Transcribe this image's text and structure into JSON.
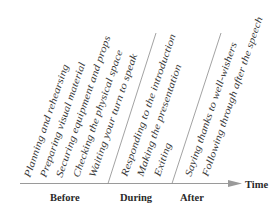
{
  "diagram": {
    "axis": {
      "label": "Time",
      "color": "#9a9a9a"
    },
    "phases": [
      {
        "label": "Before",
        "items": [
          "Planning and rehearsing",
          "Preparing visual material",
          "Securing equipment and props",
          "Checking the physical space",
          "Waiting your turn to speak"
        ]
      },
      {
        "label": "During",
        "items": [
          "Responding to the introduction",
          "Making the presentation",
          "Exiting"
        ]
      },
      {
        "label": "After",
        "items": [
          "Saying thanks to well-wishers",
          "Following through after the speech"
        ]
      }
    ]
  }
}
